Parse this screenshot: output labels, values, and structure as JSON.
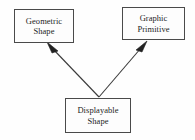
{
  "diagram": {
    "type": "generalization-hierarchy",
    "background_color": "#fefefe",
    "line_color": "#3a3a3a",
    "box_border_color": "#4a4a4a",
    "box_fill_color": "#fdfdfd",
    "text_color": "#1d1d1d",
    "nodes": [
      {
        "id": "geometric-shape",
        "label": "Geometric\nShape",
        "lines": [
          "Geometric",
          "Shape"
        ],
        "x": 14,
        "y": 9,
        "width": 60,
        "height": 34
      },
      {
        "id": "graphic-primitive",
        "label": "Graphic\nPrimitive",
        "lines": [
          "Graphic",
          "Primitive"
        ],
        "x": 122,
        "y": 7,
        "width": 63,
        "height": 33
      },
      {
        "id": "displayable-shape",
        "label": "Displayable\nShape",
        "lines": [
          "Displayable",
          "Shape"
        ],
        "x": 65,
        "y": 98,
        "width": 66,
        "height": 35
      }
    ],
    "edges": [
      {
        "id": "displayable-to-geometric",
        "from": "displayable-shape",
        "to": "geometric-shape",
        "arrowhead": "solid-triangle",
        "label": "",
        "x1": 99,
        "y1": 97,
        "x2": 48,
        "y2": 44
      },
      {
        "id": "displayable-to-graphic",
        "from": "displayable-shape",
        "to": "graphic-primitive",
        "arrowhead": "solid-triangle",
        "label": "",
        "x1": 99,
        "y1": 97,
        "x2": 146,
        "y2": 42
      }
    ]
  }
}
